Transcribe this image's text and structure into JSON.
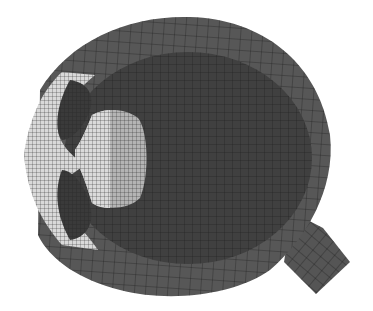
{
  "figure": {
    "background": "#ffffff",
    "regions": [
      {
        "name": "sclera",
        "color": "#575757"
      },
      {
        "name": "vitreous",
        "color": "#3f3f3f"
      },
      {
        "name": "cornea",
        "color": "#d9d9d9"
      },
      {
        "name": "aqueous",
        "color": "#3a3a3a"
      },
      {
        "name": "lens-anterior",
        "color": "#dadada"
      },
      {
        "name": "lens-posterior",
        "color": "#b4b4b4"
      },
      {
        "name": "optic-nerve",
        "color": "#555555"
      }
    ],
    "mesh_line_color": "#1e1e1e"
  }
}
